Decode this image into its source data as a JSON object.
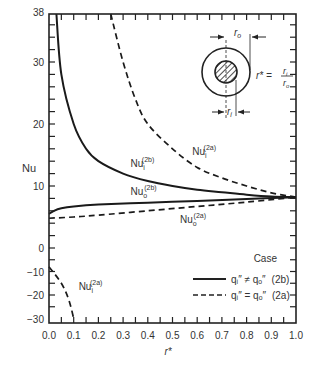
{
  "chart_data": {
    "type": "line",
    "title": "",
    "xlabel": "r*",
    "ylabel": "Nu",
    "xlim": [
      0.0,
      1.0
    ],
    "ylim": [
      -30,
      38
    ],
    "y_axis_note": "broken scale: compressed below 0",
    "grid": false,
    "x_ticks": [
      "0.0",
      "0.1",
      "0.2",
      "0.3",
      "0.4",
      "0.5",
      "0.6",
      "0.7",
      "0.8",
      "0.9",
      "1.0"
    ],
    "y_ticks": [
      "38",
      "30",
      "20",
      "10",
      "0",
      "−10",
      "−20",
      "−30"
    ],
    "legend": {
      "title": "Case",
      "position": "lower right",
      "entries": [
        {
          "style": "solid",
          "label": "qᵢ″ ≠ qₒ″",
          "case": "(2b)"
        },
        {
          "style": "dashed",
          "label": "qᵢ″ = qₒ″",
          "case": "(2a)"
        }
      ]
    },
    "series": [
      {
        "name": "Nu_i^(2b)",
        "style": "solid",
        "x": [
          0.03,
          0.05,
          0.1,
          0.15,
          0.2,
          0.3,
          0.4,
          0.5,
          0.6,
          0.7,
          0.8,
          0.9,
          1.0
        ],
        "y": [
          38,
          28,
          20,
          16,
          14,
          12,
          10.8,
          10,
          9.4,
          9,
          8.6,
          8.3,
          8.2
        ]
      },
      {
        "name": "Nu_i^(2a)",
        "style": "dashed",
        "x": [
          0.25,
          0.3,
          0.35,
          0.4,
          0.5,
          0.6,
          0.7,
          0.8,
          0.9,
          1.0
        ],
        "y": [
          38,
          30,
          24,
          20,
          16,
          13,
          11.3,
          10,
          8.9,
          8.2
        ]
      },
      {
        "name": "Nu_o^(2b)",
        "style": "solid",
        "x": [
          0,
          0.02,
          0.05,
          0.1,
          0.2,
          0.4,
          0.6,
          0.8,
          1.0
        ],
        "y": [
          5.5,
          6,
          6.4,
          6.7,
          7,
          7.3,
          7.6,
          7.9,
          8.2
        ]
      },
      {
        "name": "Nu_o^(2a)",
        "style": "dashed",
        "x": [
          0,
          0.1,
          0.2,
          0.4,
          0.6,
          0.8,
          1.0
        ],
        "y": [
          4.8,
          5,
          5.3,
          6,
          6.7,
          7.4,
          8.2
        ]
      },
      {
        "name": "Nu_i^(2a) (negative branch)",
        "style": "dashed",
        "x": [
          0,
          0.05,
          0.08,
          0.1
        ],
        "y": [
          -8,
          -15,
          -22,
          -30
        ]
      }
    ],
    "annotations": [
      {
        "text": "Nu",
        "sub": "i",
        "sup": "(2b)",
        "at": [
          0.33,
          13
        ]
      },
      {
        "text": "Nu",
        "sub": "i",
        "sup": "(2a)",
        "at": [
          0.58,
          15
        ]
      },
      {
        "text": "Nu",
        "sub": "o",
        "sup": "(2b)",
        "at": [
          0.33,
          8.5
        ]
      },
      {
        "text": "Nu",
        "sub": "o",
        "sup": "(2a)",
        "at": [
          0.53,
          4
        ]
      },
      {
        "text": "Nu",
        "sub": "i",
        "sup": "(2a)",
        "at": [
          0.12,
          -18
        ]
      }
    ],
    "inset": {
      "description": "annulus cross-section: outer circle radius r_o, hatched inner cylinder radius r_i",
      "labels": {
        "outer": "r",
        "outer_sub": "o",
        "inner": "r",
        "inner_sub": "i"
      },
      "formula": {
        "lhs": "r* =",
        "num": "r",
        "num_sub": "i",
        "den": "r",
        "den_sub": "o"
      }
    }
  }
}
